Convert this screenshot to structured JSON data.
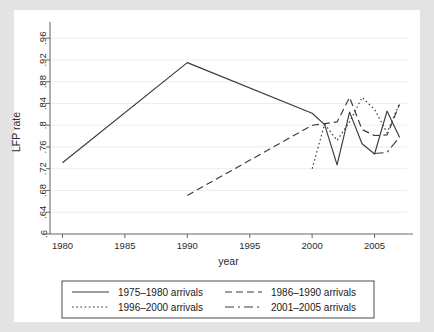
{
  "chart_data": {
    "type": "line",
    "title": "",
    "xlabel": "year",
    "ylabel": "LFP rate",
    "xlim": [
      1979,
      2007.6
    ],
    "ylim": [
      0.6,
      0.975
    ],
    "grid": true,
    "legend_position": "bottom",
    "xticks": [
      1980,
      1985,
      1990,
      1995,
      2000,
      2005
    ],
    "xticklabels": [
      "1980",
      "1985",
      "1990",
      "1995",
      "2000",
      "2005"
    ],
    "yticks": [
      0.6,
      0.64,
      0.68,
      0.72,
      0.76,
      0.8,
      0.84,
      0.88,
      0.92,
      0.96
    ],
    "yticklabels": [
      ".6",
      ".64",
      ".68",
      ".72",
      ".76",
      ".8",
      ".84",
      ".88",
      ".92",
      ".96"
    ],
    "series": [
      {
        "name": "1975–1980 arrivals",
        "style": "solid",
        "x": [
          1980,
          1990,
          2000,
          2001,
          2002,
          2003,
          2004,
          2005,
          2006,
          2007
        ],
        "values": [
          0.731,
          0.915,
          0.822,
          0.801,
          0.727,
          0.824,
          0.766,
          0.747,
          0.826,
          0.778
        ]
      },
      {
        "name": "1986–1990 arrivals",
        "style": "dashed",
        "x": [
          1990,
          2000,
          2001,
          2002,
          2003,
          2004,
          2005,
          2006,
          2007
        ],
        "values": [
          0.671,
          0.8,
          0.803,
          0.806,
          0.851,
          0.792,
          0.781,
          0.782,
          0.838
        ]
      },
      {
        "name": "1996–2000 arrivals",
        "style": "dotted",
        "x": [
          2000,
          2001,
          2002,
          2003,
          2004,
          2005,
          2006,
          2007
        ],
        "values": [
          0.72,
          0.802,
          0.772,
          0.806,
          0.851,
          0.829,
          0.786,
          0.84
        ]
      },
      {
        "name": "2001–2005 arrivals",
        "style": "dashdot",
        "x": [
          2005,
          2006,
          2007
        ],
        "values": [
          0.748,
          0.75,
          0.778
        ]
      }
    ],
    "legend": [
      {
        "label": "1975–1980 arrivals",
        "style": "solid"
      },
      {
        "label": "1986–1990 arrivals",
        "style": "dashed"
      },
      {
        "label": "1996–2000 arrivals",
        "style": "dotted"
      },
      {
        "label": "2001–2005 arrivals",
        "style": "dashdot"
      }
    ],
    "colors": {
      "line": "#3a3a3a",
      "grid": "#ededed",
      "axis": "#6f6f6f",
      "plot_background": "#ffffff",
      "outer_background": "#e3e3e3"
    }
  }
}
